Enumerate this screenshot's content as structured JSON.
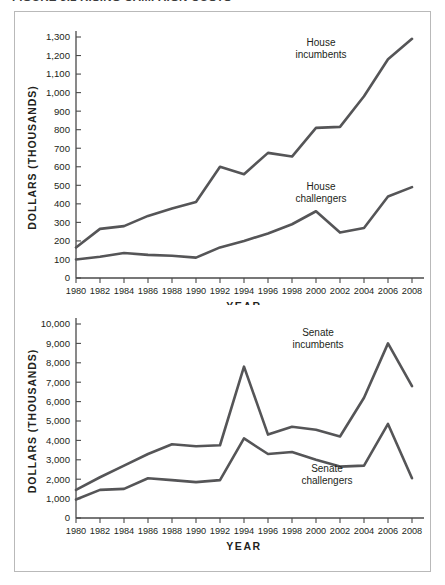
{
  "figure": {
    "caption": "FIGURE 5.1  RISING CAMPAIGN COSTS"
  },
  "chart_data": [
    {
      "type": "line",
      "title": "House campaign spending",
      "xlabel": "YEAR",
      "ylabel": "DOLLARS (THOUSANDS)",
      "x": [
        1980,
        1982,
        1984,
        1986,
        1988,
        1990,
        1992,
        1994,
        1996,
        1998,
        2000,
        2002,
        2004,
        2006,
        2008
      ],
      "xtick_labels": [
        "1980",
        "1982",
        "1984",
        "1986",
        "1988",
        "1990",
        "1992",
        "1994",
        "1996",
        "1998",
        "2000",
        "2002",
        "2004",
        "2006",
        "2008"
      ],
      "ytick_labels": [
        "0",
        "100",
        "200",
        "300",
        "400",
        "500",
        "600",
        "700",
        "800",
        "900",
        "1,000",
        "1,100",
        "1,200",
        "1,300"
      ],
      "ytick_values": [
        0,
        100,
        200,
        300,
        400,
        500,
        600,
        700,
        800,
        900,
        1000,
        1100,
        1200,
        1300
      ],
      "ylim": [
        0,
        1300
      ],
      "grid": false,
      "legend_position": "inline-annotations",
      "series": [
        {
          "name": "House incumbents",
          "label": "House\nincumbents",
          "label_line1": "House",
          "label_line2": "incumbents",
          "values": [
            165,
            265,
            280,
            335,
            375,
            410,
            600,
            560,
            675,
            655,
            810,
            815,
            980,
            1180,
            1290
          ]
        },
        {
          "name": "House challengers",
          "label": "House\nchallengers",
          "label_line1": "House",
          "label_line2": "challengers",
          "values": [
            100,
            115,
            135,
            125,
            120,
            110,
            165,
            200,
            240,
            290,
            360,
            245,
            270,
            440,
            490
          ]
        }
      ]
    },
    {
      "type": "line",
      "title": "Senate campaign spending",
      "xlabel": "YEAR",
      "ylabel": "DOLLARS (THOUSANDS)",
      "x": [
        1980,
        1982,
        1984,
        1986,
        1988,
        1990,
        1992,
        1994,
        1996,
        1998,
        2000,
        2002,
        2004,
        2006,
        2008
      ],
      "xtick_labels": [
        "1980",
        "1982",
        "1984",
        "1986",
        "1988",
        "1990",
        "1992",
        "1994",
        "1996",
        "1998",
        "2000",
        "2002",
        "2004",
        "2006",
        "2008"
      ],
      "ytick_labels": [
        "0",
        "1,000",
        "2,000",
        "3,000",
        "4,000",
        "5,000",
        "6,000",
        "7,000",
        "8,000",
        "9,000",
        "10,000"
      ],
      "ytick_values": [
        0,
        1000,
        2000,
        3000,
        4000,
        5000,
        6000,
        7000,
        8000,
        9000,
        10000
      ],
      "ylim": [
        0,
        10000
      ],
      "grid": false,
      "legend_position": "inline-annotations",
      "series": [
        {
          "name": "Senate incumbents",
          "label": "Senate\nincumbents",
          "label_line1": "Senate",
          "label_line2": "incumbents",
          "values": [
            1450,
            2100,
            2700,
            3300,
            3800,
            3700,
            3750,
            7800,
            4300,
            4700,
            4550,
            4200,
            6200,
            9000,
            6800
          ]
        },
        {
          "name": "Senate challengers",
          "label": "Senate\nchallengers",
          "label_line1": "Senate",
          "label_line2": "challengers",
          "values": [
            950,
            1450,
            1500,
            2050,
            1950,
            1850,
            1950,
            4100,
            3300,
            3400,
            3000,
            2650,
            2700,
            4850,
            2050
          ]
        }
      ]
    }
  ]
}
